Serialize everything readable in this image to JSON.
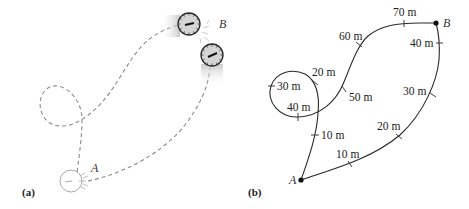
{
  "panel_a": {
    "label": "(a)",
    "point_a": "A",
    "point_b": "B"
  },
  "panel_b": {
    "label": "(b)",
    "point_a": "A",
    "point_b": "B",
    "path1_markers": [
      "10 m",
      "20 m",
      "30 m",
      "40 m",
      "50 m",
      "60 m",
      "70 m"
    ],
    "path2_markers": [
      "10 m",
      "20 m",
      "30 m",
      "40 m"
    ]
  },
  "colors": {
    "path_dashed": "#8a8a8a",
    "path_solid": "#2a2a2a",
    "clock_face": "#d8d8d8",
    "clock_rim": "#2a2a2a"
  }
}
